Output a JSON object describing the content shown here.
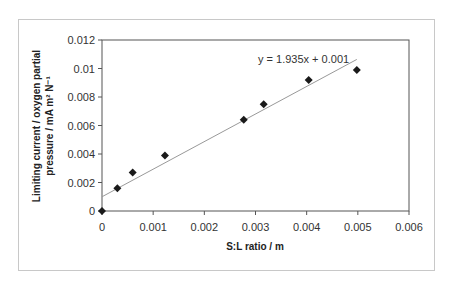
{
  "chart_data": {
    "type": "scatter",
    "title": "",
    "xlabel": "S:L ratio / m",
    "ylabel_line1": "Limiting current / oxygen partial",
    "ylabel_line2": "pressure / mA m² N⁻¹",
    "xlim": [
      0,
      0.006
    ],
    "ylim": [
      0,
      0.012
    ],
    "x_ticks": [
      "0",
      "0.001",
      "0.002",
      "0.003",
      "0.004",
      "0.005",
      "0.006"
    ],
    "y_ticks": [
      "0",
      "0.002",
      "0.004",
      "0.006",
      "0.008",
      "0.01",
      "0.012"
    ],
    "grid": false,
    "legend": null,
    "series": [
      {
        "name": "data",
        "marker": "diamond",
        "color": "#1a1a1a",
        "x": [
          0,
          0.0003,
          0.0006,
          0.00123,
          0.00277,
          0.00316,
          0.00404,
          0.00498
        ],
        "y": [
          0,
          0.0016,
          0.0027,
          0.0039,
          0.0064,
          0.0075,
          0.0092,
          0.0099
        ]
      }
    ],
    "trendline": {
      "type": "linear",
      "slope": 1.935,
      "intercept": 0.001,
      "x_range": [
        0,
        0.00498
      ],
      "color": "#999999",
      "label": "y = 1.935x + 0.001"
    }
  }
}
